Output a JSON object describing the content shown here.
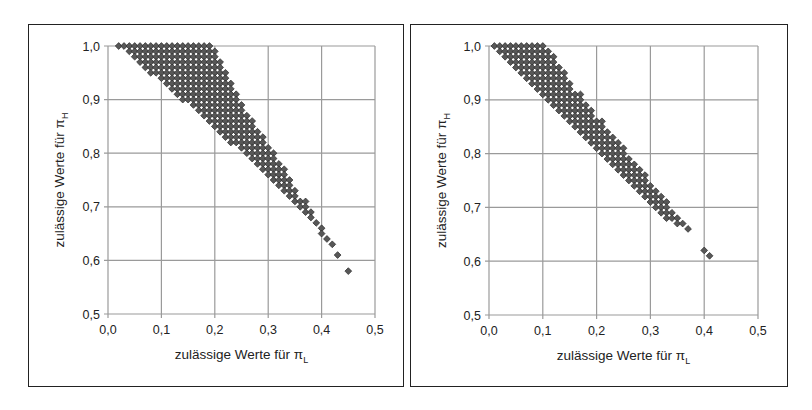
{
  "colors": {
    "grid": "#9a9a9a",
    "marker_fill": "#575757",
    "marker_stroke": "#2a2a2a",
    "frame": "#222222"
  },
  "chart_data": [
    {
      "type": "scatter",
      "title": "",
      "xlabel": "zulässige Werte für π_L",
      "ylabel": "zulässige Werte für π_H",
      "xlabel_main": "zulässige Werte für π",
      "xlabel_sub": "L",
      "ylabel_main": "zulässige Werte für π",
      "ylabel_sub": "H",
      "xlim": [
        0.0,
        0.5
      ],
      "ylim": [
        0.5,
        1.0
      ],
      "xticks": [
        "0,0",
        "0,1",
        "0,2",
        "0,3",
        "0,4",
        "0,5"
      ],
      "yticks": [
        "0,5",
        "0,6",
        "0,7",
        "0,8",
        "0,9",
        "1,0"
      ],
      "grid": true,
      "step": 0.01,
      "rows_description": "each row: [piH, piL_min, piL_max] — lattice points every 0.01",
      "rows": [
        [
          1.0,
          0.02,
          0.19
        ],
        [
          0.99,
          0.04,
          0.2
        ],
        [
          0.98,
          0.05,
          0.2
        ],
        [
          0.97,
          0.06,
          0.21
        ],
        [
          0.96,
          0.07,
          0.21
        ],
        [
          0.95,
          0.08,
          0.22
        ],
        [
          0.94,
          0.1,
          0.22
        ],
        [
          0.93,
          0.11,
          0.23
        ],
        [
          0.92,
          0.12,
          0.23
        ],
        [
          0.91,
          0.13,
          0.24
        ],
        [
          0.9,
          0.14,
          0.24
        ],
        [
          0.89,
          0.16,
          0.25
        ],
        [
          0.88,
          0.17,
          0.25
        ],
        [
          0.87,
          0.18,
          0.26
        ],
        [
          0.86,
          0.19,
          0.27
        ],
        [
          0.85,
          0.2,
          0.27
        ],
        [
          0.84,
          0.21,
          0.28
        ],
        [
          0.83,
          0.22,
          0.29
        ],
        [
          0.82,
          0.23,
          0.29
        ],
        [
          0.81,
          0.25,
          0.3
        ],
        [
          0.8,
          0.26,
          0.31
        ],
        [
          0.79,
          0.27,
          0.31
        ],
        [
          0.78,
          0.28,
          0.32
        ],
        [
          0.77,
          0.29,
          0.33
        ],
        [
          0.76,
          0.3,
          0.33
        ],
        [
          0.75,
          0.31,
          0.34
        ],
        [
          0.74,
          0.32,
          0.34
        ],
        [
          0.73,
          0.33,
          0.35
        ],
        [
          0.72,
          0.34,
          0.35
        ],
        [
          0.71,
          0.35,
          0.37
        ],
        [
          0.7,
          0.36,
          0.37
        ],
        [
          0.69,
          0.37,
          0.38
        ],
        [
          0.68,
          0.38,
          0.38
        ],
        [
          0.67,
          0.39,
          0.39
        ],
        [
          0.66,
          0.4,
          0.4
        ],
        [
          0.65,
          0.4,
          0.4
        ],
        [
          0.64,
          0.41,
          0.41
        ],
        [
          0.63,
          0.42,
          0.42
        ],
        [
          0.61,
          0.43,
          0.43
        ],
        [
          0.58,
          0.45,
          0.45
        ]
      ],
      "extra_points": []
    },
    {
      "type": "scatter",
      "title": "",
      "xlabel": "zulässige Werte für π_L",
      "ylabel": "zulässige Werte für π_H",
      "xlabel_main": "zulässige Werte für π",
      "xlabel_sub": "L",
      "ylabel_main": "zulässige Werte für π",
      "ylabel_sub": "H",
      "xlim": [
        0.0,
        0.5
      ],
      "ylim": [
        0.5,
        1.0
      ],
      "xticks": [
        "0,0",
        "0,1",
        "0,2",
        "0,3",
        "0,4",
        "0,5"
      ],
      "yticks": [
        "0,5",
        "0,6",
        "0,7",
        "0,8",
        "0,9",
        "1,0"
      ],
      "grid": true,
      "step": 0.01,
      "rows_description": "each row: [piH, piL_min, piL_max] — lattice points every 0.01",
      "rows": [
        [
          1.0,
          0.01,
          0.1
        ],
        [
          0.99,
          0.02,
          0.11
        ],
        [
          0.98,
          0.03,
          0.12
        ],
        [
          0.97,
          0.04,
          0.12
        ],
        [
          0.96,
          0.05,
          0.13
        ],
        [
          0.95,
          0.06,
          0.14
        ],
        [
          0.94,
          0.07,
          0.14
        ],
        [
          0.93,
          0.08,
          0.15
        ],
        [
          0.92,
          0.09,
          0.15
        ],
        [
          0.91,
          0.1,
          0.17
        ],
        [
          0.9,
          0.11,
          0.17
        ],
        [
          0.89,
          0.12,
          0.18
        ],
        [
          0.88,
          0.13,
          0.19
        ],
        [
          0.87,
          0.14,
          0.19
        ],
        [
          0.86,
          0.15,
          0.21
        ],
        [
          0.85,
          0.16,
          0.21
        ],
        [
          0.84,
          0.17,
          0.22
        ],
        [
          0.83,
          0.18,
          0.23
        ],
        [
          0.82,
          0.19,
          0.24
        ],
        [
          0.81,
          0.2,
          0.25
        ],
        [
          0.8,
          0.21,
          0.25
        ],
        [
          0.79,
          0.22,
          0.26
        ],
        [
          0.78,
          0.23,
          0.27
        ],
        [
          0.77,
          0.24,
          0.28
        ],
        [
          0.76,
          0.25,
          0.29
        ],
        [
          0.75,
          0.26,
          0.29
        ],
        [
          0.74,
          0.27,
          0.3
        ],
        [
          0.73,
          0.28,
          0.31
        ],
        [
          0.72,
          0.29,
          0.32
        ],
        [
          0.71,
          0.3,
          0.33
        ],
        [
          0.7,
          0.31,
          0.33
        ],
        [
          0.69,
          0.32,
          0.34
        ],
        [
          0.68,
          0.33,
          0.35
        ],
        [
          0.67,
          0.35,
          0.36
        ],
        [
          0.66,
          0.37,
          0.37
        ]
      ],
      "extra_points": [
        [
          0.4,
          0.62
        ],
        [
          0.41,
          0.61
        ]
      ]
    }
  ],
  "layout": {
    "panels": [
      {
        "left": 28,
        "top": 24,
        "width": 376,
        "height": 363,
        "plot": {
          "x0": 79,
          "y0": 21,
          "w": 267,
          "h": 268
        }
      },
      {
        "left": 410,
        "top": 24,
        "width": 378,
        "height": 363,
        "plot": {
          "x0": 78,
          "y0": 21,
          "w": 269,
          "h": 269
        }
      }
    ]
  }
}
